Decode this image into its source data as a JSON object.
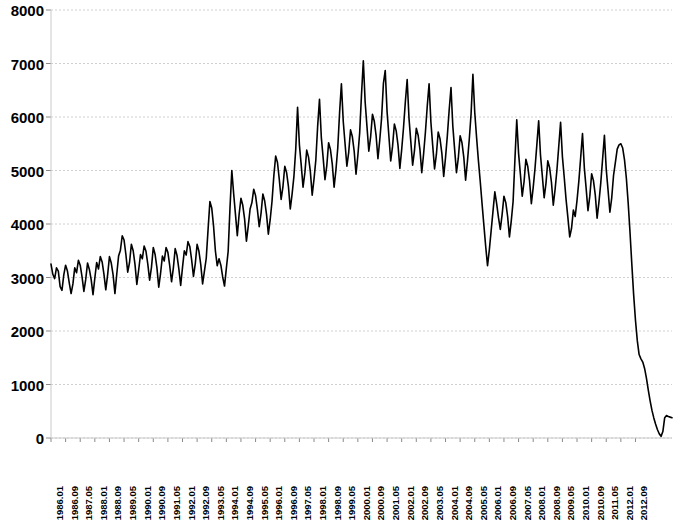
{
  "chart_data": {
    "type": "line",
    "title": "",
    "subtitle": "",
    "xlabel": "",
    "ylabel": "",
    "ylim": [
      0,
      8000
    ],
    "y_ticks": [
      0,
      1000,
      2000,
      3000,
      4000,
      5000,
      6000,
      7000,
      8000
    ],
    "grid": true,
    "grid_axis": "y",
    "grid_style": "dotted",
    "legend": false,
    "legend_position": "none",
    "line_color": "#000000",
    "line_width": 1.6,
    "markers": false,
    "x_tick_labels": [
      "1986.01",
      "1986.09",
      "1987.05",
      "1988.01",
      "1988.09",
      "1989.05",
      "1990.01",
      "1990.09",
      "1991.05",
      "1992.01",
      "1992.09",
      "1993.05",
      "1994.01",
      "1994.09",
      "1995.05",
      "1996.01",
      "1996.09",
      "1997.05",
      "1998.01",
      "1998.09",
      "1999.05",
      "2000.01",
      "2000.09",
      "2001.05",
      "2002.01",
      "2002.09",
      "2003.05",
      "2004.01",
      "2004.09",
      "2005.05",
      "2006.01",
      "2006.09",
      "2007.05",
      "2008.01",
      "2008.09",
      "2009.05",
      "2010.01",
      "2010.09",
      "2011.05",
      "2012.01",
      "2012.09"
    ],
    "x_tick_interval_months": 8,
    "x_start": "1986.01",
    "x_end": "2012.09",
    "n_points": 321,
    "series": [
      {
        "name": "series-1",
        "values": [
          3250,
          3060,
          2980,
          3180,
          3120,
          2830,
          2760,
          3050,
          3230,
          3120,
          2900,
          2700,
          2880,
          3180,
          3090,
          3320,
          3230,
          3010,
          2740,
          2960,
          3270,
          3150,
          2960,
          2680,
          2990,
          3280,
          3160,
          3390,
          3290,
          3060,
          2770,
          3050,
          3390,
          3270,
          3050,
          2700,
          3060,
          3400,
          3510,
          3780,
          3700,
          3430,
          3100,
          3280,
          3620,
          3500,
          3240,
          2870,
          3140,
          3430,
          3350,
          3590,
          3490,
          3250,
          2950,
          3190,
          3560,
          3430,
          3180,
          2820,
          3080,
          3400,
          3310,
          3560,
          3470,
          3220,
          2920,
          3180,
          3540,
          3410,
          3160,
          2850,
          3190,
          3500,
          3420,
          3670,
          3580,
          3330,
          3020,
          3260,
          3620,
          3490,
          3240,
          2880,
          3120,
          3360,
          3900,
          4420,
          4300,
          3960,
          3500,
          3220,
          3350,
          3230,
          3010,
          2840,
          3170,
          3490,
          4300,
          5000,
          4570,
          4180,
          3780,
          4180,
          4480,
          4350,
          4090,
          3680,
          3960,
          4280,
          4400,
          4650,
          4530,
          4270,
          3950,
          4200,
          4560,
          4430,
          4180,
          3810,
          4080,
          4420,
          4900,
          5270,
          5150,
          4830,
          4460,
          4700,
          5080,
          4960,
          4700,
          4280,
          4560,
          4890,
          5400,
          6180,
          5480,
          5100,
          4690,
          4960,
          5380,
          5250,
          4980,
          4540,
          4840,
          5200,
          5830,
          6330,
          5620,
          5240,
          4830,
          5090,
          5520,
          5390,
          5120,
          4690,
          5010,
          5420,
          6080,
          6620,
          5920,
          5500,
          5080,
          5340,
          5760,
          5630,
          5360,
          4930,
          5280,
          5700,
          6420,
          7050,
          6280,
          5820,
          5360,
          5630,
          6050,
          5920,
          5650,
          5220,
          5570,
          5980,
          6630,
          6870,
          6100,
          5640,
          5180,
          5450,
          5870,
          5740,
          5470,
          5040,
          5390,
          5800,
          6280,
          6700,
          5980,
          5540,
          5100,
          5370,
          5790,
          5660,
          5390,
          4960,
          5310,
          5720,
          6200,
          6620,
          5900,
          5460,
          5030,
          5300,
          5720,
          5590,
          5320,
          4890,
          5240,
          5650,
          6130,
          6550,
          5830,
          5390,
          4960,
          5230,
          5650,
          5520,
          5250,
          4820,
          5170,
          5580,
          6060,
          6800,
          6090,
          5620,
          5190,
          4800,
          4380,
          3980,
          3580,
          3220,
          3520,
          3880,
          4240,
          4600,
          4380,
          4120,
          3900,
          4180,
          4520,
          4400,
          4140,
          3760,
          4060,
          4420,
          5200,
          5950,
          5320,
          4930,
          4520,
          4790,
          5210,
          5080,
          4810,
          4380,
          4680,
          5040,
          5480,
          5930,
          5290,
          4900,
          4490,
          4760,
          5180,
          5050,
          4780,
          4350,
          4650,
          5010,
          5450,
          5900,
          5260,
          4870,
          4460,
          4120,
          3760,
          3920,
          4260,
          4140,
          4440,
          4800,
          5240,
          5690,
          5050,
          4660,
          4250,
          4520,
          4940,
          4810,
          4540,
          4110,
          4410,
          4770,
          5210,
          5660,
          5020,
          4630,
          4220,
          4490,
          4910,
          5150,
          5400,
          5480,
          5500,
          5420,
          5200,
          4860,
          4400,
          3850,
          3250,
          2680,
          2200,
          1820,
          1560,
          1480,
          1420,
          1300,
          1120,
          900,
          700,
          520,
          380,
          260,
          160,
          80,
          30,
          120,
          380,
          420,
          400,
          390,
          380
        ]
      }
    ]
  },
  "axes": {
    "y_axis_name": "value-axis",
    "x_axis_name": "time-axis"
  }
}
